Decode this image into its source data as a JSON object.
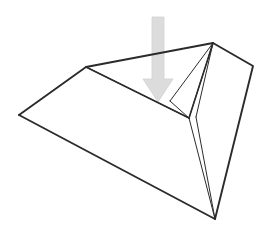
{
  "figure": {
    "name": "deformed-polyhedron-with-force-arrow",
    "description": "A wireframe 3D shape resembling a folded sheet or pyramid-like solid, drawn in thin black outline on a white background, with a thick light-gray arrow pointing straight down into a depressed facet near the center.",
    "background_color": "#ffffff",
    "canvas": {
      "width": 274,
      "height": 239
    }
  },
  "style": {
    "outline_color": "#2b2b2b",
    "outline_width_outer": 1.8,
    "outline_width_inner": 1.0,
    "face_fill": "#ffffff",
    "arrow_fill": "#dcdcdc",
    "arrow_edge": "#d2d2d2",
    "arrow_label": "downward force"
  },
  "geometry": {
    "vertices": {
      "apex_top_right": {
        "label": "A",
        "x": 213,
        "y": 43
      },
      "ridge_left": {
        "label": "B",
        "x": 86,
        "y": 67
      },
      "left_corner": {
        "label": "C",
        "x": 19,
        "y": 115
      },
      "bottom_corner": {
        "label": "D",
        "x": 215,
        "y": 219
      },
      "right_corner": {
        "label": "E",
        "x": 253,
        "y": 66
      },
      "valley_junction": {
        "label": "F",
        "x": 189,
        "y": 118
      },
      "crease_mid": {
        "label": "G",
        "x": 170,
        "y": 101
      },
      "crease_inner": {
        "label": "H",
        "x": 196,
        "y": 117
      }
    },
    "faces": [
      {
        "name": "large-left-face",
        "points": "86,67 19,115 215,219 189,118"
      },
      {
        "name": "right-side-face",
        "points": "213,43 253,66 215,219 196,117"
      },
      {
        "name": "upper-crease-face",
        "points": "213,43 189,118 170,101"
      },
      {
        "name": "lower-crease-face",
        "points": "213,43 196,117 189,118"
      }
    ],
    "outer_outline": "19,115 86,67 213,43 253,66 215,219",
    "inner_edges": [
      {
        "name": "ridge-left-to-junction",
        "x1": 86,
        "y1": 67,
        "x2": 189,
        "y2": 118
      },
      {
        "name": "apex-to-junction",
        "x1": 213,
        "y1": 43,
        "x2": 189,
        "y2": 118
      },
      {
        "name": "apex-to-crease-mid",
        "x1": 213,
        "y1": 43,
        "x2": 170,
        "y2": 101
      },
      {
        "name": "apex-to-crease-inner",
        "x1": 213,
        "y1": 43,
        "x2": 196,
        "y2": 117
      },
      {
        "name": "crease-mid-to-junction",
        "x1": 170,
        "y1": 101,
        "x2": 189,
        "y2": 118
      },
      {
        "name": "junction-to-bottom",
        "x1": 189,
        "y1": 118,
        "x2": 215,
        "y2": 219
      },
      {
        "name": "crease-inner-to-bottom",
        "x1": 196,
        "y1": 117,
        "x2": 215,
        "y2": 219
      }
    ]
  },
  "arrow": {
    "name": "downward-force-arrow",
    "direction": "down",
    "shaft": {
      "x": 152,
      "y": 17,
      "width": 12,
      "height": 64
    },
    "head": {
      "left_x": 143,
      "right_x": 173,
      "top_y": 79,
      "tip_x": 158,
      "tip_y": 102
    },
    "polygon": "152,17 164,17 164,79 173,79 158,102 143,79 152,79"
  }
}
